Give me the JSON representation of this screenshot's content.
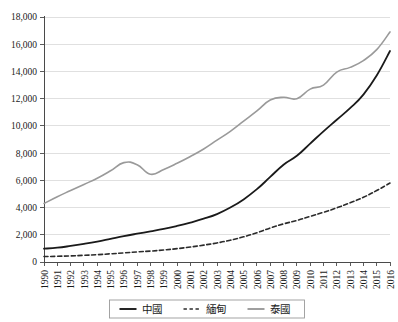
{
  "chart_data": {
    "type": "line",
    "title": "",
    "subtitle": "",
    "xlabel": "",
    "ylabel": "",
    "grid": true,
    "legend_position": "bottom",
    "xlim": [
      1990,
      2016
    ],
    "ylim": [
      0,
      18000
    ],
    "ytick_step": 2000,
    "categories": [
      "1990",
      "1991",
      "1992",
      "1993",
      "1994",
      "1995",
      "1996",
      "1997",
      "1998",
      "1999",
      "2000",
      "2001",
      "2002",
      "2003",
      "2004",
      "2005",
      "2006",
      "2007",
      "2008",
      "2009",
      "2010",
      "2011",
      "2012",
      "2013",
      "2014",
      "2015",
      "2016"
    ],
    "ytick_labels": [
      "0",
      "2,000",
      "4,000",
      "6,000",
      "8,000",
      "10,000",
      "12,000",
      "14,000",
      "16,000",
      "18,000"
    ],
    "ytick_values": [
      0,
      2000,
      4000,
      6000,
      8000,
      10000,
      12000,
      14000,
      16000,
      18000
    ],
    "series": [
      {
        "name": "中國",
        "style": "solid",
        "color": "#1a1a1a",
        "width": 1.8,
        "values": [
          980,
          1050,
          1180,
          1330,
          1500,
          1700,
          1900,
          2080,
          2250,
          2430,
          2650,
          2900,
          3180,
          3520,
          4000,
          4600,
          5350,
          6250,
          7150,
          7800,
          8700,
          9600,
          10450,
          11300,
          12300,
          13700,
          15500
        ]
      },
      {
        "name": "緬甸",
        "style": "dashed",
        "color": "#2b2b2b",
        "width": 1.6,
        "values": [
          400,
          420,
          450,
          490,
          540,
          600,
          670,
          740,
          800,
          880,
          980,
          1100,
          1240,
          1400,
          1600,
          1850,
          2150,
          2500,
          2800,
          3050,
          3350,
          3650,
          3980,
          4350,
          4750,
          5250,
          5800
        ]
      },
      {
        "name": "泰國",
        "style": "solid",
        "color": "#9a9a9a",
        "width": 1.6,
        "values": [
          4300,
          4800,
          5250,
          5700,
          6150,
          6700,
          7300,
          7150,
          6450,
          6800,
          7250,
          7750,
          8300,
          8950,
          9600,
          10350,
          11100,
          11900,
          12100,
          12000,
          12700,
          13000,
          13950,
          14300,
          14800,
          15600,
          16900
        ]
      }
    ]
  },
  "legend": {
    "items": [
      {
        "label": "中國",
        "style": "solid",
        "color": "#1a1a1a"
      },
      {
        "label": "緬甸",
        "style": "dashed",
        "color": "#2b2b2b"
      },
      {
        "label": "泰國",
        "style": "solid",
        "color": "#9a9a9a"
      }
    ]
  }
}
